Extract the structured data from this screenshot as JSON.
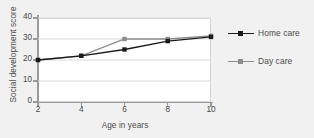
{
  "chart_data": {
    "type": "line",
    "title": "",
    "xlabel": "Age in years",
    "ylabel": "Social development score",
    "x": [
      2,
      4,
      6,
      8,
      10
    ],
    "xticks": [
      "2",
      "4",
      "6",
      "8",
      "10"
    ],
    "yticks": [
      "0",
      "10",
      "20",
      "30",
      "40"
    ],
    "xlim": [
      2,
      10
    ],
    "ylim": [
      0,
      40
    ],
    "grid": "horizontal",
    "legend_position": "right",
    "series": [
      {
        "name": "Home care",
        "color": "#1a1a1a",
        "marker": "square",
        "values": [
          20,
          22,
          25,
          29,
          31
        ]
      },
      {
        "name": "Day care",
        "color": "#8c8c8c",
        "marker": "square",
        "values": [
          20,
          22,
          30,
          30,
          31.5
        ]
      }
    ]
  },
  "legend": {
    "items": [
      {
        "label": "Home care"
      },
      {
        "label": "Day care"
      }
    ]
  },
  "colors": {
    "background": "#f1f1f1",
    "plot_background": "#ffffff",
    "gridline": "#d9d9d9",
    "axis": "#9a9a9a",
    "text": "#4a4a4a",
    "series_home_care": "#1a1a1a",
    "series_day_care": "#8c8c8c"
  }
}
